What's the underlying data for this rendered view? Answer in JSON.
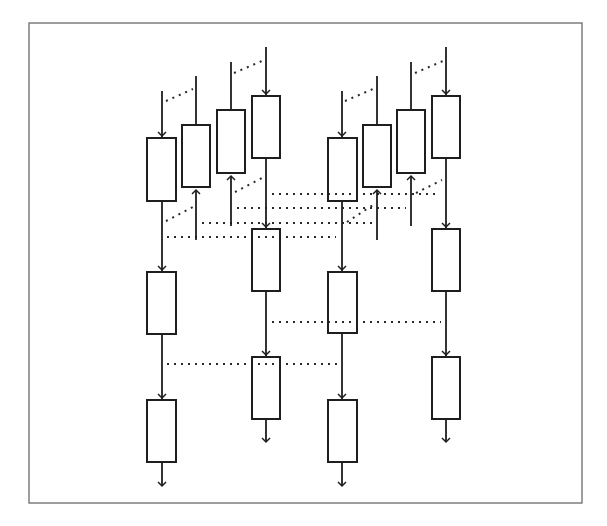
{
  "diagram": {
    "type": "pipeline-dependency-diagram",
    "canvas": {
      "width": 607,
      "height": 526,
      "background": "#ffffff"
    },
    "frame": {
      "x": 29,
      "y": 23,
      "width": 553,
      "height": 480,
      "color": "#6a6a6a"
    },
    "colors": {
      "stroke": "#1e1e1e",
      "dots": "#2a2a2a",
      "box_fill": "#ffffff"
    },
    "groups": [
      {
        "name": "group-1",
        "columns": [
          {
            "name": "col-a",
            "x": 162,
            "line_top": 91,
            "boxes": [
              [
                147,
                138,
                29,
                63
              ],
              [
                147,
                272,
                29,
                62
              ],
              [
                147,
                400,
                29,
                62
              ]
            ],
            "exit_arrow_y": 486
          },
          {
            "name": "col-b",
            "x": 196,
            "line_top": 76,
            "boxes": [
              [
                182,
                125,
                28,
                62
              ]
            ],
            "up_arrow": [
              240,
              190
            ]
          },
          {
            "name": "col-c",
            "x": 231,
            "line_top": 62,
            "boxes": [
              [
                217,
                110,
                28,
                63
              ]
            ],
            "up_arrow": [
              226,
              176
            ]
          },
          {
            "name": "col-d",
            "x": 266,
            "line_top": 47,
            "boxes": [
              [
                252,
                96,
                28,
                62
              ],
              [
                252,
                229,
                28,
                62
              ],
              [
                252,
                357,
                28,
                62
              ]
            ],
            "exit_arrow_y": 442
          }
        ]
      },
      {
        "name": "group-2",
        "columns": [
          {
            "name": "col-a",
            "x": 342,
            "line_top": 91,
            "boxes": [
              [
                328,
                138,
                29,
                63
              ],
              [
                328,
                272,
                29,
                61
              ],
              [
                328,
                400,
                29,
                62
              ]
            ],
            "exit_arrow_y": 486
          },
          {
            "name": "col-b",
            "x": 377,
            "line_top": 76,
            "boxes": [
              [
                363,
                125,
                28,
                62
              ]
            ],
            "up_arrow": [
              240,
              190
            ]
          },
          {
            "name": "col-c",
            "x": 411,
            "line_top": 62,
            "boxes": [
              [
                397,
                110,
                28,
                63
              ]
            ],
            "up_arrow": [
              226,
              176
            ]
          },
          {
            "name": "col-d",
            "x": 446,
            "line_top": 47,
            "boxes": [
              [
                432,
                96,
                28,
                62
              ],
              [
                432,
                229,
                28,
                62
              ],
              [
                432,
                357,
                28,
                62
              ]
            ],
            "exit_arrow_y": 442
          }
        ]
      }
    ],
    "dotted_links": [
      {
        "name": "top-diag-1a",
        "from": [
          166,
          101
        ],
        "to": [
          193,
          89
        ]
      },
      {
        "name": "top-diag-1c",
        "from": [
          234,
          73
        ],
        "to": [
          262,
          61
        ]
      },
      {
        "name": "top-diag-2a",
        "from": [
          345,
          101
        ],
        "to": [
          373,
          89
        ]
      },
      {
        "name": "top-diag-2c",
        "from": [
          415,
          73
        ],
        "to": [
          443,
          61
        ]
      },
      {
        "name": "mid-diag-1a",
        "from": [
          166,
          221
        ],
        "to": [
          193,
          207
        ]
      },
      {
        "name": "mid-diag-1c",
        "from": [
          235,
          192
        ],
        "to": [
          262,
          178
        ]
      },
      {
        "name": "mid-diag-2a",
        "from": [
          347,
          222
        ],
        "to": [
          373,
          205
        ]
      },
      {
        "name": "mid-diag-2c",
        "from": [
          416,
          193
        ],
        "to": [
          442,
          180
        ]
      },
      {
        "name": "row-194",
        "from": [
          272,
          194
        ],
        "to": [
          440,
          194
        ]
      },
      {
        "name": "row-208",
        "from": [
          237,
          208
        ],
        "to": [
          406,
          208
        ]
      },
      {
        "name": "row-223",
        "from": [
          202,
          223
        ],
        "to": [
          372,
          223
        ]
      },
      {
        "name": "row-237",
        "from": [
          167,
          237
        ],
        "to": [
          336,
          237
        ]
      },
      {
        "name": "row-322",
        "from": [
          272,
          322
        ],
        "to": [
          441,
          322
        ]
      },
      {
        "name": "row-364",
        "from": [
          167,
          364
        ],
        "to": [
          338,
          364
        ]
      }
    ]
  }
}
